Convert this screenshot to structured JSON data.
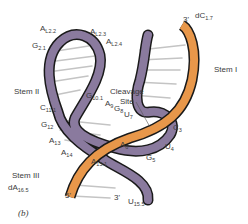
{
  "figure": {
    "panel_label": "(b)",
    "colors": {
      "enzyme_strand": "#8a7a9e",
      "substrate_strand": "#e8974a",
      "outline": "#1a1a1a",
      "base_pairs": "#c8c8c8"
    },
    "stems": [
      {
        "id": "stem-1",
        "label": "Stem I"
      },
      {
        "id": "stem-2",
        "label": "Stem II"
      },
      {
        "id": "stem-3",
        "label": "Stem III"
      }
    ],
    "annotation": {
      "line1": "Cleavage",
      "line2": "Site"
    },
    "nucleotides": [
      {
        "base": "A",
        "sub": "L2.2"
      },
      {
        "base": "A",
        "sub": "L2.3"
      },
      {
        "base": "A",
        "sub": "L2.4"
      },
      {
        "base": "G",
        "sub": "2.1"
      },
      {
        "base": "G",
        "sub": "10.1"
      },
      {
        "base": "A",
        "sub": "9"
      },
      {
        "base": "G",
        "sub": "8"
      },
      {
        "base": "U",
        "sub": "7"
      },
      {
        "base": "C",
        "sub": "11.1"
      },
      {
        "base": "G",
        "sub": "12"
      },
      {
        "base": "A",
        "sub": "13"
      },
      {
        "base": "A",
        "sub": "14"
      },
      {
        "base": "A",
        "sub": "15.1"
      },
      {
        "base": "A",
        "sub": "6"
      },
      {
        "base": "G",
        "sub": "5"
      },
      {
        "base": "U",
        "sub": "4"
      },
      {
        "base": "C",
        "sub": "3"
      },
      {
        "base": "dC",
        "sub": "1.7"
      },
      {
        "base": "dA",
        "sub": "16.5"
      },
      {
        "base": "U",
        "sub": "15.5"
      }
    ],
    "strand_ends": {
      "top_3prime": "3'",
      "bottom_5prime": "5'",
      "bottom_3prime": "3'",
      "inner_5prime": "5'"
    },
    "strand_text": {
      "c17": "dC17",
      "c171": "C17.1",
      "g11": "G1.1",
      "f161": "f16.1"
    }
  }
}
